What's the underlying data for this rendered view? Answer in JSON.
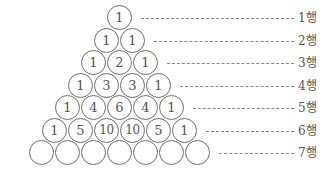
{
  "rows": [
    {
      "label": "1행",
      "values": [
        "1"
      ]
    },
    {
      "label": "2행",
      "values": [
        "1",
        "1"
      ]
    },
    {
      "label": "3행",
      "values": [
        "1",
        "2",
        "1"
      ]
    },
    {
      "label": "4행",
      "values": [
        "1",
        "3",
        "3",
        "1"
      ]
    },
    {
      "label": "5행",
      "values": [
        "1",
        "4",
        "6",
        "4",
        "1"
      ]
    },
    {
      "label": "6행",
      "values": [
        "1",
        "5",
        "10",
        "10",
        "5",
        "1"
      ]
    },
    {
      "label": "7행",
      "values": [
        "",
        "",
        "",
        "",
        "",
        "",
        ""
      ]
    }
  ],
  "colors": {
    "stroke": "#6e6e6e",
    "text": "#555555",
    "dash": "#888888"
  }
}
